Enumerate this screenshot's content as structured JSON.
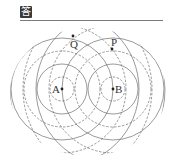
{
  "header": {
    "badge_text": "答",
    "badge_icon": "answer-icon"
  },
  "figure": {
    "sources": [
      {
        "label": "A"
      },
      {
        "label": "B"
      }
    ],
    "points": [
      {
        "label": "Q"
      },
      {
        "label": "P"
      }
    ],
    "legend": {
      "solid": "crest",
      "dashed": "trough"
    },
    "colors": {
      "line": "#6e6e6e",
      "dot": "#222222",
      "text": "#333333"
    }
  }
}
